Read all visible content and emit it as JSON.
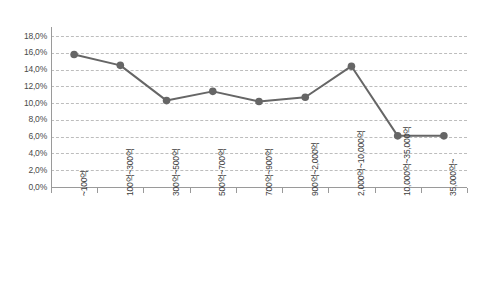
{
  "chart_data": {
    "type": "line",
    "title": "",
    "subtitle": "",
    "xlabel": "",
    "ylabel": "",
    "categories": [
      "~100억",
      "100억~300억",
      "300억~500억",
      "500억~700억",
      "700억~900억",
      "900억~2,000억",
      "2,000억~10,000억",
      "10,000억~35,000억",
      "35,000억~"
    ],
    "values": [
      15.8,
      14.5,
      10.3,
      11.4,
      10.2,
      10.7,
      14.4,
      6.1,
      6.1
    ],
    "ylim": [
      0,
      18
    ],
    "ytick_values": [
      0,
      2,
      4,
      6,
      8,
      10,
      12,
      14,
      16,
      18
    ],
    "ytick_labels": [
      "0,0%",
      "2,0%",
      "4,0%",
      "6,0%",
      "8,0%",
      "10,0%",
      "12,0%",
      "14,0%",
      "16,0%",
      "18,0%"
    ],
    "grid": true,
    "grid_style": "dashed-horizontal",
    "legend": false,
    "legend_position": "none",
    "series": [
      {
        "name": "",
        "values": [
          15.8,
          14.5,
          10.3,
          11.4,
          10.2,
          10.7,
          14.4,
          6.1,
          6.1
        ],
        "color": "#666666",
        "marker": "circle",
        "marker_size": 5,
        "line_width": 2
      }
    ],
    "colors": {
      "line": "#666666",
      "marker": "#666666",
      "grid": "#bdbdbd",
      "axis": "#9a9a9a",
      "tick_text": "#4a4a4a",
      "background": "#ffffff"
    }
  }
}
